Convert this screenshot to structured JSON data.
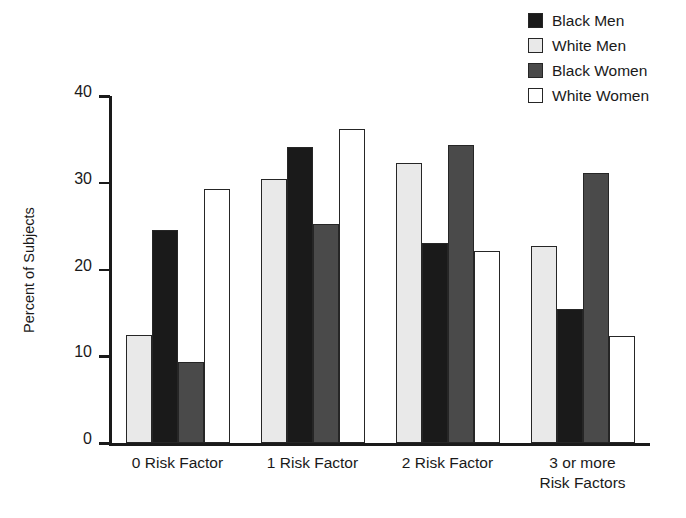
{
  "chart_data": {
    "type": "bar",
    "title": "",
    "subtitle": "",
    "xlabel": "",
    "ylabel": "Percent of Subjects",
    "ylim": [
      0,
      40
    ],
    "yticks": [
      0,
      10,
      20,
      30,
      40
    ],
    "ytick_labels": [
      "0",
      "10",
      "20",
      "30",
      "40"
    ],
    "grid": false,
    "legend_position": "top-right",
    "categories": [
      "0 Risk Factor",
      "1 Risk Factor",
      "2 Risk Factor",
      "3 or more\nRisk Factors"
    ],
    "series": [
      {
        "name": "White Men",
        "color": "#e9e9e9",
        "values": [
          12.5,
          30.4,
          32.3,
          22.7
        ]
      },
      {
        "name": "Black Men",
        "color": "#1a1a1a",
        "values": [
          24.5,
          34.1,
          23.0,
          15.5
        ]
      },
      {
        "name": "Black Women",
        "color": "#4a4a4a",
        "values": [
          9.3,
          25.2,
          34.3,
          31.1
        ]
      },
      {
        "name": "White Women",
        "color": "#ffffff",
        "values": [
          29.3,
          36.2,
          22.1,
          12.3
        ]
      }
    ],
    "legend_order": [
      {
        "name": "Black Men",
        "color": "#1a1a1a"
      },
      {
        "name": "White Men",
        "color": "#e9e9e9"
      },
      {
        "name": "Black Women",
        "color": "#4a4a4a"
      },
      {
        "name": "White Women",
        "color": "#ffffff"
      }
    ]
  },
  "colors": {
    "black_men": "#1a1a1a",
    "white_men": "#e9e9e9",
    "black_women": "#4a4a4a",
    "white_women": "#ffffff",
    "axis": "#1a1a1a",
    "bar_outline": "#262626",
    "background": "#ffffff"
  }
}
